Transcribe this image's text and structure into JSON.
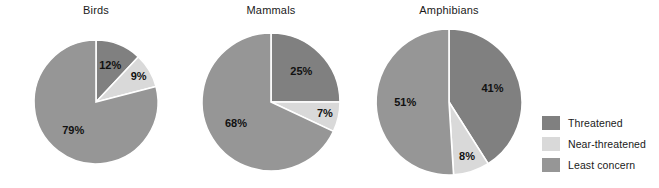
{
  "figure": {
    "background": "#ffffff",
    "width": 659,
    "height": 188
  },
  "chart_data": {
    "type": "pie",
    "title": "",
    "xlabel": "",
    "ylabel": "",
    "legend_position": "right",
    "grid": false,
    "categories": [
      "Threatened",
      "Near-threatened",
      "Least concern"
    ],
    "colors": [
      "#808080",
      "#d9d9d9",
      "#969696"
    ],
    "charts": [
      {
        "title": "Birds",
        "values": [
          12,
          9,
          79
        ],
        "labels": [
          "12%",
          "9%",
          "79%"
        ]
      },
      {
        "title": "Mammals",
        "values": [
          25,
          7,
          68
        ],
        "labels": [
          "25%",
          "7%",
          "68%"
        ]
      },
      {
        "title": "Amphibians",
        "values": [
          41,
          8,
          51
        ],
        "labels": [
          "41%",
          "8%",
          "51%"
        ]
      }
    ]
  },
  "panels": [
    {
      "title": "Birds",
      "slices": [
        {
          "label": "12%",
          "value": 12,
          "series": "Threatened"
        },
        {
          "label": "9%",
          "value": 9,
          "series": "Near-threatened"
        },
        {
          "label": "79%",
          "value": 79,
          "series": "Least concern"
        }
      ]
    },
    {
      "title": "Mammals",
      "slices": [
        {
          "label": "25%",
          "value": 25,
          "series": "Threatened"
        },
        {
          "label": "7%",
          "value": 7,
          "series": "Near-threatened"
        },
        {
          "label": "68%",
          "value": 68,
          "series": "Least concern"
        }
      ]
    },
    {
      "title": "Amphibians",
      "slices": [
        {
          "label": "41%",
          "value": 41,
          "series": "Threatened"
        },
        {
          "label": "8%",
          "value": 8,
          "series": "Near-threatened"
        },
        {
          "label": "51%",
          "value": 51,
          "series": "Least concern"
        }
      ]
    }
  ],
  "legend": {
    "items": [
      {
        "label": "Threatened",
        "color": "#808080"
      },
      {
        "label": "Near-threatened",
        "color": "#d9d9d9"
      },
      {
        "label": "Least concern",
        "color": "#969696"
      }
    ]
  },
  "layout": {
    "pies": [
      {
        "cx": 96,
        "cy": 102,
        "r": 62,
        "left": 20,
        "width": 152
      },
      {
        "cx": 271,
        "cy": 102,
        "r": 69,
        "left": 195,
        "width": 152
      },
      {
        "cx": 449,
        "cy": 102,
        "r": 73,
        "left": 372,
        "width": 154
      }
    ],
    "label_radius_factor": [
      0.62,
      0.8,
      0.6
    ]
  }
}
